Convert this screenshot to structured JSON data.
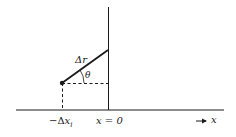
{
  "diagram": {
    "labels": {
      "delta_r": "Δr",
      "theta": "θ",
      "minus_delta_x_prefix": "−Δ",
      "minus_delta_x_var": "x",
      "minus_delta_x_sub": "i",
      "x_equals_zero": "x = 0",
      "axis_arrow": "→",
      "axis_var": "x"
    },
    "colors": {
      "ink": "#1a1a1a",
      "background": "#ffffff"
    },
    "elements": {
      "horizontal_axis": {
        "x1": 16,
        "x2": 224,
        "y": 110
      },
      "vertical_line": {
        "x": 108,
        "y1": 7,
        "y2": 110
      },
      "point": {
        "x": 62,
        "y": 83
      },
      "segment_end": {
        "x": 108,
        "y": 50
      },
      "dashed_horizontal": {
        "x1": 62,
        "x2": 108,
        "y": 83
      },
      "dashed_vertical": {
        "x": 62,
        "y1": 83,
        "y2": 110
      }
    }
  }
}
